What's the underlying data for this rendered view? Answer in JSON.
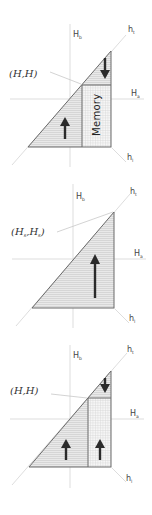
{
  "figure": {
    "panels": [
      {
        "id": "panel-1",
        "axis_labels": {
          "vertical": "H",
          "vertical_sub": "b",
          "horizontal": "H",
          "horizontal_sub": "a",
          "diag_up": "h",
          "diag_up_sub": "t",
          "diag_down": "h",
          "diag_down_sub": "l"
        },
        "point_label": "(H,H)",
        "regions": [
          {
            "name": "lower-left-hatched",
            "arrow": "up"
          },
          {
            "name": "upper-right-hatched",
            "arrow": "down"
          },
          {
            "name": "memory-grid",
            "label": "Memory"
          }
        ]
      },
      {
        "id": "panel-2",
        "axis_labels": {
          "vertical": "H",
          "vertical_sub": "b",
          "horizontal": "H",
          "horizontal_sub": "a",
          "diag_up": "h",
          "diag_up_sub": "t",
          "diag_down": "h",
          "diag_down_sub": "l"
        },
        "point_label": "(H",
        "point_label_sub1": "s",
        "point_label_mid": ",H",
        "point_label_sub2": "s",
        "point_label_end": ")",
        "regions": [
          {
            "name": "full-triangle-hatched",
            "arrow": "up"
          }
        ]
      },
      {
        "id": "panel-3",
        "axis_labels": {
          "vertical": "H",
          "vertical_sub": "b",
          "horizontal": "H",
          "horizontal_sub": "a",
          "diag_up": "h",
          "diag_up_sub": "t",
          "diag_down": "h",
          "diag_down_sub": "l"
        },
        "point_label": "(H,H)",
        "regions": [
          {
            "name": "lower-left-hatched",
            "arrow": "up"
          },
          {
            "name": "upper-right-hatched",
            "arrow": "down"
          },
          {
            "name": "right-grid",
            "arrow": "up"
          }
        ]
      }
    ],
    "colors": {
      "fill": "#e6e6e6",
      "hatch": "#c9c9c9",
      "grid": "#d6d6d6",
      "edge": "#6a6a6a",
      "axis": "#d4d4d4",
      "arrow": "#2b2b2b"
    }
  }
}
